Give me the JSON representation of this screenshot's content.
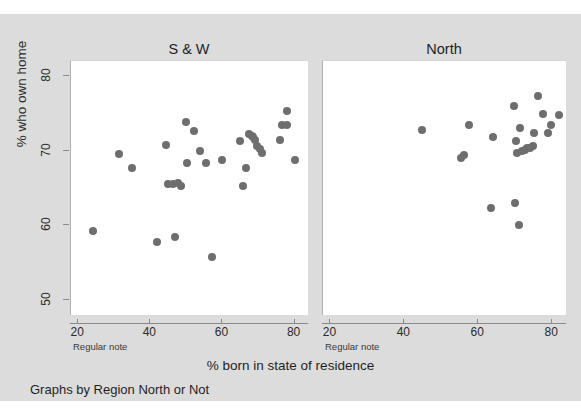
{
  "chart_data": {
    "type": "scatter",
    "title": "",
    "xlabel": "% born in state of residence",
    "ylabel": "% who own home",
    "caption": "Graphs by Region North or Not",
    "panel_note": "Regular note",
    "xlim": [
      18,
      84
    ],
    "ylim": [
      48,
      82
    ],
    "xticks": [
      20,
      40,
      60,
      80
    ],
    "yticks": [
      50,
      60,
      70,
      80
    ],
    "grid": false,
    "legend": "none",
    "marker_color": "#6e6e6e",
    "background_color": "#dcdcdc",
    "panel_background_color": "#ffffff",
    "panels": [
      {
        "label": "S & W",
        "points": [
          {
            "x": 24.0,
            "y": 59.3
          },
          {
            "x": 31.4,
            "y": 69.5
          },
          {
            "x": 35.0,
            "y": 67.7
          },
          {
            "x": 41.8,
            "y": 57.8
          },
          {
            "x": 44.3,
            "y": 70.8
          },
          {
            "x": 45.0,
            "y": 65.6
          },
          {
            "x": 46.2,
            "y": 65.6
          },
          {
            "x": 46.8,
            "y": 58.5
          },
          {
            "x": 47.6,
            "y": 65.7
          },
          {
            "x": 48.6,
            "y": 65.3
          },
          {
            "x": 49.9,
            "y": 73.9
          },
          {
            "x": 50.2,
            "y": 68.4
          },
          {
            "x": 52.1,
            "y": 72.6
          },
          {
            "x": 53.9,
            "y": 69.9
          },
          {
            "x": 55.5,
            "y": 68.3
          },
          {
            "x": 57.1,
            "y": 55.8
          },
          {
            "x": 60.0,
            "y": 68.7
          },
          {
            "x": 64.9,
            "y": 71.3
          },
          {
            "x": 65.6,
            "y": 65.3
          },
          {
            "x": 66.6,
            "y": 67.7
          },
          {
            "x": 67.4,
            "y": 72.2
          },
          {
            "x": 68.2,
            "y": 72.0
          },
          {
            "x": 68.6,
            "y": 71.8
          },
          {
            "x": 69.1,
            "y": 71.4
          },
          {
            "x": 69.6,
            "y": 70.6
          },
          {
            "x": 70.3,
            "y": 70.2
          },
          {
            "x": 71.1,
            "y": 69.7
          },
          {
            "x": 75.9,
            "y": 71.4
          },
          {
            "x": 76.6,
            "y": 73.4
          },
          {
            "x": 77.8,
            "y": 73.4
          },
          {
            "x": 77.9,
            "y": 75.3
          },
          {
            "x": 80.1,
            "y": 68.7
          }
        ]
      },
      {
        "label": "North",
        "points": [
          {
            "x": 44.9,
            "y": 72.7
          },
          {
            "x": 55.4,
            "y": 69.0
          },
          {
            "x": 56.2,
            "y": 69.4
          },
          {
            "x": 57.6,
            "y": 73.4
          },
          {
            "x": 63.4,
            "y": 62.3
          },
          {
            "x": 64.1,
            "y": 71.8
          },
          {
            "x": 69.6,
            "y": 76.0
          },
          {
            "x": 69.9,
            "y": 63.0
          },
          {
            "x": 70.2,
            "y": 71.3
          },
          {
            "x": 70.6,
            "y": 69.7
          },
          {
            "x": 71.0,
            "y": 60.1
          },
          {
            "x": 71.4,
            "y": 73.0
          },
          {
            "x": 71.9,
            "y": 69.9
          },
          {
            "x": 72.6,
            "y": 70.1
          },
          {
            "x": 73.3,
            "y": 70.3
          },
          {
            "x": 74.1,
            "y": 70.4
          },
          {
            "x": 74.8,
            "y": 70.6
          },
          {
            "x": 75.2,
            "y": 72.3
          },
          {
            "x": 76.2,
            "y": 77.3
          },
          {
            "x": 77.5,
            "y": 74.9
          },
          {
            "x": 78.8,
            "y": 72.3
          },
          {
            "x": 79.6,
            "y": 73.4
          },
          {
            "x": 81.8,
            "y": 74.8
          }
        ]
      }
    ]
  }
}
